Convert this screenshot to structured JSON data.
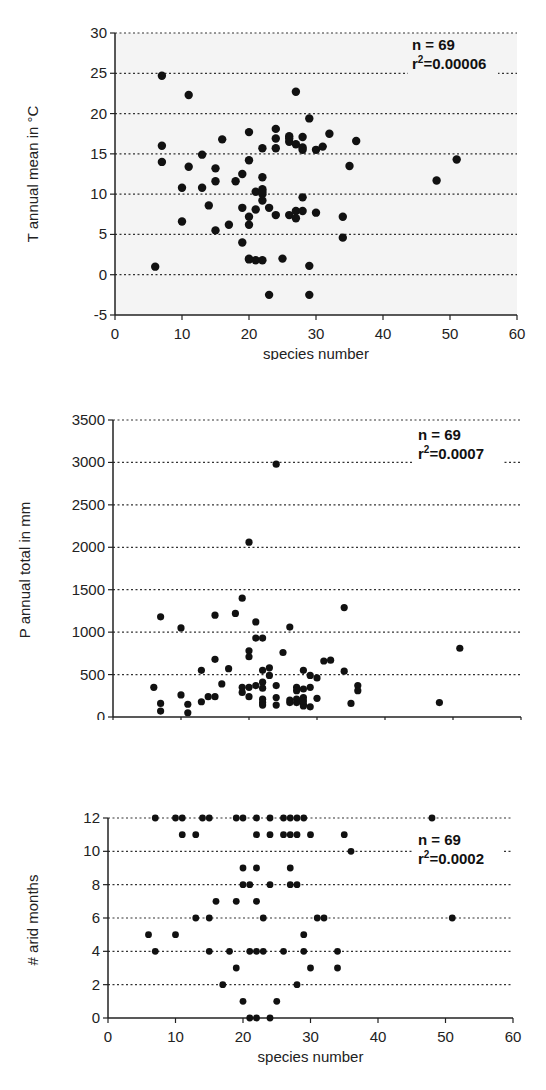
{
  "chart_data": [
    {
      "type": "scatter",
      "title": "",
      "xlabel": "species number",
      "ylabel": "T annual mean in °C",
      "xlim": [
        0,
        60
      ],
      "ylim": [
        -5,
        30
      ],
      "xticks": [
        0,
        10,
        20,
        30,
        40,
        50,
        60
      ],
      "yticks": [
        -5,
        0,
        5,
        10,
        15,
        20,
        25,
        30
      ],
      "grid": "horizontal dotted",
      "background": "#f4f4f4",
      "annotation": {
        "n": "n = 69",
        "r2_prefix": "r",
        "r2_sup": "2",
        "r2_value": "=0.00006"
      },
      "points": [
        [
          7,
          24.7
        ],
        [
          11,
          22.3
        ],
        [
          7,
          16
        ],
        [
          7,
          14
        ],
        [
          10,
          10.8
        ],
        [
          10,
          6.6
        ],
        [
          6,
          1
        ],
        [
          13,
          14.9
        ],
        [
          11,
          13.4
        ],
        [
          13,
          10.8
        ],
        [
          14,
          8.6
        ],
        [
          15,
          13.2
        ],
        [
          15,
          11.6
        ],
        [
          15,
          5.5
        ],
        [
          16,
          16.8
        ],
        [
          17,
          6.2
        ],
        [
          18,
          11.6
        ],
        [
          19,
          12.5
        ],
        [
          19,
          8.3
        ],
        [
          19,
          4
        ],
        [
          20,
          17.7
        ],
        [
          20,
          14.2
        ],
        [
          20,
          7.2
        ],
        [
          20,
          6.2
        ],
        [
          20,
          2
        ],
        [
          21,
          10.3
        ],
        [
          21,
          8.1
        ],
        [
          21,
          1.8
        ],
        [
          22,
          15.7
        ],
        [
          22,
          12.1
        ],
        [
          22,
          10.6
        ],
        [
          22,
          10
        ],
        [
          22,
          9.2
        ],
        [
          22,
          1.8
        ],
        [
          23,
          8.3
        ],
        [
          23,
          -2.5
        ],
        [
          24,
          18.1
        ],
        [
          24,
          16.9
        ],
        [
          24,
          15.7
        ],
        [
          24,
          7.4
        ],
        [
          25,
          2
        ],
        [
          26,
          17.2
        ],
        [
          26,
          16.5
        ],
        [
          26,
          7.4
        ],
        [
          27,
          22.7
        ],
        [
          27,
          16.2
        ],
        [
          27,
          7.9
        ],
        [
          27,
          7
        ],
        [
          28,
          17.1
        ],
        [
          28,
          15.5
        ],
        [
          28,
          9.6
        ],
        [
          28,
          7.9
        ],
        [
          29,
          19.4
        ],
        [
          29,
          1.1
        ],
        [
          29,
          -2.5
        ],
        [
          30,
          15.5
        ],
        [
          30,
          7.7
        ],
        [
          31,
          15.9
        ],
        [
          32,
          17.5
        ],
        [
          34,
          7.2
        ],
        [
          34,
          4.6
        ],
        [
          35,
          13.5
        ],
        [
          36,
          16.6
        ],
        [
          48,
          11.7
        ],
        [
          51,
          14.3
        ],
        [
          20,
          1.9
        ],
        [
          22,
          10.3
        ],
        [
          26,
          16.9
        ],
        [
          28,
          15.8
        ]
      ]
    },
    {
      "type": "scatter",
      "title": "",
      "xlabel": "species number",
      "ylabel": "P annual total in mm",
      "xlim": [
        0,
        60
      ],
      "ylim": [
        0,
        3500
      ],
      "xticks": [
        0,
        10,
        20,
        30,
        40,
        50,
        60
      ],
      "yticks": [
        0,
        500,
        1000,
        1500,
        2000,
        2500,
        3000,
        3500
      ],
      "grid": "horizontal dotted",
      "background": "#ffffff",
      "annotation": {
        "n": "n = 69",
        "r2_prefix": "r",
        "r2_sup": "2",
        "r2_value": "=0.0007"
      },
      "points": [
        [
          24,
          2980
        ],
        [
          20,
          2060
        ],
        [
          19,
          1400
        ],
        [
          18,
          1220
        ],
        [
          15,
          1200
        ],
        [
          7,
          1180
        ],
        [
          21,
          1120
        ],
        [
          10,
          1050
        ],
        [
          26,
          1060
        ],
        [
          34,
          1290
        ],
        [
          51,
          810
        ],
        [
          21,
          930
        ],
        [
          22,
          930
        ],
        [
          20,
          780
        ],
        [
          20,
          710
        ],
        [
          25,
          760
        ],
        [
          15,
          680
        ],
        [
          31,
          660
        ],
        [
          32,
          670
        ],
        [
          17,
          570
        ],
        [
          13,
          550
        ],
        [
          22,
          550
        ],
        [
          23,
          580
        ],
        [
          23,
          490
        ],
        [
          28,
          550
        ],
        [
          34,
          540
        ],
        [
          29,
          490
        ],
        [
          30,
          460
        ],
        [
          16,
          390
        ],
        [
          6,
          350
        ],
        [
          19,
          350
        ],
        [
          20,
          350
        ],
        [
          21,
          370
        ],
        [
          22,
          410
        ],
        [
          22,
          340
        ],
        [
          24,
          370
        ],
        [
          27,
          350
        ],
        [
          27,
          310
        ],
        [
          28,
          330
        ],
        [
          29,
          350
        ],
        [
          36,
          370
        ],
        [
          36,
          310
        ],
        [
          19,
          290
        ],
        [
          20,
          240
        ],
        [
          10,
          260
        ],
        [
          14,
          240
        ],
        [
          15,
          240
        ],
        [
          13,
          180
        ],
        [
          22,
          210
        ],
        [
          22,
          170
        ],
        [
          22,
          140
        ],
        [
          24,
          230
        ],
        [
          24,
          140
        ],
        [
          26,
          200
        ],
        [
          26,
          170
        ],
        [
          27,
          210
        ],
        [
          27,
          170
        ],
        [
          28,
          230
        ],
        [
          28,
          150
        ],
        [
          28,
          130
        ],
        [
          29,
          120
        ],
        [
          30,
          220
        ],
        [
          35,
          160
        ],
        [
          48,
          170
        ],
        [
          7,
          160
        ],
        [
          7,
          70
        ],
        [
          11,
          150
        ],
        [
          11,
          50
        ],
        [
          28,
          190
        ]
      ]
    },
    {
      "type": "scatter",
      "title": "",
      "xlabel": "species number",
      "ylabel": "# arid months",
      "xlim": [
        0,
        60
      ],
      "ylim": [
        0,
        12
      ],
      "xticks": [
        0,
        10,
        20,
        30,
        40,
        50,
        60
      ],
      "yticks": [
        0,
        2,
        4,
        6,
        8,
        10,
        12
      ],
      "grid": "horizontal dotted",
      "background": "#ffffff",
      "annotation": {
        "n": "n = 69",
        "r2_prefix": "r",
        "r2_sup": "2",
        "r2_value": "=0.0002"
      },
      "points": [
        [
          7,
          12
        ],
        [
          10,
          12
        ],
        [
          11,
          12
        ],
        [
          14,
          12
        ],
        [
          15,
          12
        ],
        [
          19,
          12
        ],
        [
          20,
          12
        ],
        [
          22,
          12
        ],
        [
          24,
          12
        ],
        [
          26,
          12
        ],
        [
          27,
          12
        ],
        [
          28,
          12
        ],
        [
          29,
          12
        ],
        [
          48,
          12
        ],
        [
          11,
          11
        ],
        [
          13,
          11
        ],
        [
          22,
          11
        ],
        [
          24,
          11
        ],
        [
          26,
          11
        ],
        [
          27,
          11
        ],
        [
          28,
          11
        ],
        [
          30,
          11
        ],
        [
          35,
          11
        ],
        [
          36,
          10
        ],
        [
          20,
          9
        ],
        [
          22,
          9
        ],
        [
          27,
          9
        ],
        [
          20,
          8
        ],
        [
          21,
          8
        ],
        [
          24,
          8
        ],
        [
          27,
          8
        ],
        [
          28,
          8
        ],
        [
          16,
          7
        ],
        [
          19,
          7
        ],
        [
          22,
          7
        ],
        [
          13,
          6
        ],
        [
          15,
          6
        ],
        [
          23,
          6
        ],
        [
          31,
          6
        ],
        [
          32,
          6
        ],
        [
          51,
          6
        ],
        [
          6,
          5
        ],
        [
          10,
          5
        ],
        [
          29,
          5
        ],
        [
          7,
          4
        ],
        [
          15,
          4
        ],
        [
          18,
          4
        ],
        [
          21,
          4
        ],
        [
          22,
          4
        ],
        [
          23,
          4
        ],
        [
          26,
          4
        ],
        [
          29,
          4
        ],
        [
          34,
          4
        ],
        [
          19,
          3
        ],
        [
          30,
          3
        ],
        [
          34,
          3
        ],
        [
          17,
          2
        ],
        [
          28,
          2
        ],
        [
          20,
          1
        ],
        [
          25,
          1
        ],
        [
          21,
          0
        ],
        [
          22,
          0
        ],
        [
          24,
          0
        ]
      ]
    }
  ]
}
